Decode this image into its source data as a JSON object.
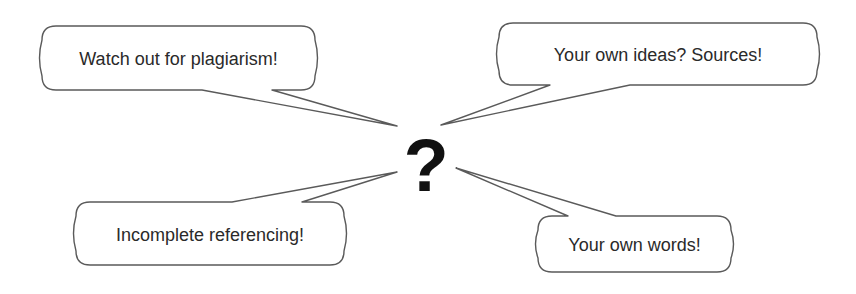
{
  "diagram": {
    "type": "speech-bubbles-around-center",
    "center": {
      "symbol": "?",
      "x": 426,
      "y": 166
    },
    "bubbles": [
      {
        "id": "plagiarism",
        "text": "Watch out for plagiarism!",
        "box": {
          "x": 42,
          "y": 26,
          "w": 273,
          "h": 64
        },
        "tail": {
          "base": [
            [
              202,
              90
            ],
            [
              272,
              90
            ]
          ],
          "tip": [
            397,
            126
          ]
        }
      },
      {
        "id": "sources",
        "text": "Your own ideas? Sources!",
        "box": {
          "x": 499,
          "y": 23,
          "w": 318,
          "h": 62
        },
        "tail": {
          "base": [
            [
              550,
              85
            ],
            [
              630,
              85
            ]
          ],
          "tip": [
            441,
            125
          ]
        }
      },
      {
        "id": "referencing",
        "text": "Incomplete referencing!",
        "box": {
          "x": 76,
          "y": 202,
          "w": 268,
          "h": 63
        },
        "tail": {
          "base": [
            [
              232,
              202
            ],
            [
              302,
              202
            ]
          ],
          "tip": [
            397,
            172
          ]
        }
      },
      {
        "id": "words",
        "text": "Your own words!",
        "box": {
          "x": 538,
          "y": 216,
          "w": 193,
          "h": 56
        },
        "tail": {
          "base": [
            [
              568,
              216
            ],
            [
              616,
              216
            ]
          ],
          "tip": [
            456,
            168
          ]
        }
      }
    ],
    "colors": {
      "stroke": "#5a5a5a",
      "text": "#2a2a2a",
      "center": "#111111",
      "background": "#ffffff"
    }
  }
}
